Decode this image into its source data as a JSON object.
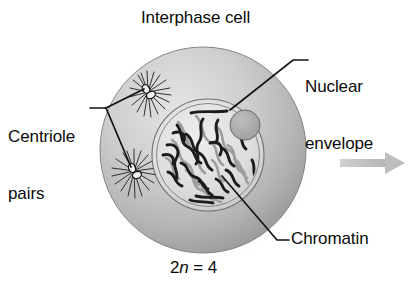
{
  "figure": {
    "title": "Interphase cell",
    "caption_prefix": "2",
    "caption_italic": "n",
    "caption_suffix": " = 4",
    "labels": {
      "nuclear_envelope_line1": "Nuclear",
      "nuclear_envelope_line2": "envelope",
      "centriole_pairs_line1": "Centriole",
      "centriole_pairs_line2": "pairs",
      "chromatin": "Chromatin"
    },
    "colors": {
      "background": "#ffffff",
      "text": "#0a0a0a",
      "leader_line": "#111111",
      "cytoplasm_light": "#d8d8d8",
      "cytoplasm_mid": "#b9b9b9",
      "cytoplasm_dark": "#8e8e8e",
      "cell_outline": "#7d7d7d",
      "nucleoplasm": "#e2e2e2",
      "nuclear_envelope_stroke": "#6d6d6d",
      "nucleolus_fill": "#a8a8a8",
      "nucleolus_stroke": "#6a6a6a",
      "chromatin_dark": "#1c1c1c",
      "chromatin_light": "#9a9a9a",
      "centriole_fill": "#f0f0f0",
      "centriole_stroke": "#121212",
      "aster_stroke": "#1a1a1a",
      "arrow": "#bdbdbd",
      "shadow": "#c9c9c9"
    },
    "structures": [
      {
        "name": "cell-body",
        "shape": "circle",
        "cx": 203,
        "cy": 150,
        "r": 103
      },
      {
        "name": "nucleus",
        "shape": "circle",
        "cx": 208,
        "cy": 155,
        "r": 56
      },
      {
        "name": "nucleolus",
        "shape": "circle",
        "cx": 245,
        "cy": 125,
        "r": 15
      },
      {
        "name": "centriole-pair-upper",
        "shape": "aster",
        "cx": 148,
        "cy": 92
      },
      {
        "name": "centriole-pair-lower",
        "shape": "aster",
        "cx": 134,
        "cy": 171
      },
      {
        "name": "progression-arrow",
        "shape": "arrow",
        "x1": 340,
        "x2": 405,
        "y": 163
      }
    ]
  }
}
